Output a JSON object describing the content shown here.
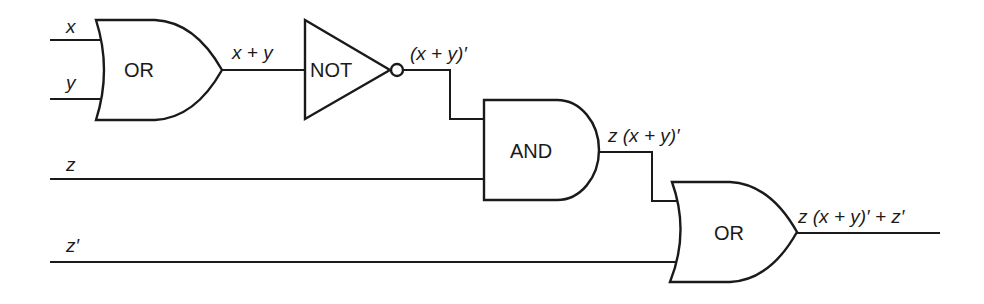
{
  "diagram": {
    "type": "logic-circuit",
    "colors": {
      "stroke": "#1a1a1a",
      "background": "#ffffff"
    },
    "inputs": [
      {
        "id": "x",
        "label": "x"
      },
      {
        "id": "y",
        "label": "y"
      },
      {
        "id": "z",
        "label": "z"
      },
      {
        "id": "z_prime",
        "label": "z′"
      }
    ],
    "gates": [
      {
        "id": "or1",
        "type": "OR",
        "label": "OR",
        "inputs": [
          "x",
          "y"
        ],
        "output_label": "x + y"
      },
      {
        "id": "not1",
        "type": "NOT",
        "label": "NOT",
        "inputs": [
          "or1"
        ],
        "output_label": "(x + y)′"
      },
      {
        "id": "and1",
        "type": "AND",
        "label": "AND",
        "inputs": [
          "not1",
          "z"
        ],
        "output_label": "z (x + y)′"
      },
      {
        "id": "or2",
        "type": "OR",
        "label": "OR",
        "inputs": [
          "and1",
          "z_prime"
        ],
        "output_label": "z (x + y)′ + z′"
      }
    ]
  }
}
